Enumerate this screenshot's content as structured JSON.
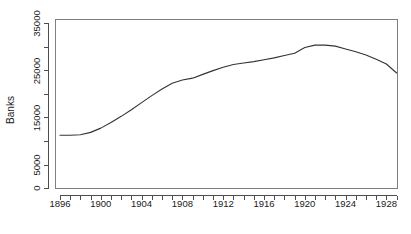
{
  "chart_data": {
    "type": "line",
    "title": "",
    "subtitle": "",
    "xlabel": "",
    "ylabel": "Banks",
    "xlim": [
      1895.0,
      1929.8
    ],
    "ylim": [
      0,
      36000
    ],
    "grid": false,
    "legend": null,
    "y_ticks": [
      0,
      5000,
      10000,
      15000,
      20000,
      25000,
      30000,
      35000
    ],
    "y_tick_labels": [
      "0",
      "5000",
      "",
      "15000",
      "",
      "25000",
      "",
      "35000"
    ],
    "x_ticks": [
      1896,
      1897,
      1898,
      1899,
      1900,
      1901,
      1902,
      1903,
      1904,
      1905,
      1906,
      1907,
      1908,
      1909,
      1910,
      1911,
      1912,
      1913,
      1914,
      1915,
      1916,
      1917,
      1918,
      1919,
      1920,
      1921,
      1922,
      1923,
      1924,
      1925,
      1926,
      1927,
      1928,
      1929
    ],
    "x_tick_labels": [
      "1896",
      "",
      "",
      "",
      "1900",
      "",
      "",
      "",
      "1904",
      "",
      "",
      "",
      "1908",
      "",
      "",
      "",
      "1912",
      "",
      "",
      "",
      "1916",
      "",
      "",
      "",
      "1920",
      "",
      "",
      "",
      "1924",
      "",
      "",
      "",
      "1928",
      ""
    ],
    "series": [
      {
        "name": "Banks",
        "x": [
          1896,
          1897,
          1898,
          1899,
          1900,
          1901,
          1902,
          1903,
          1904,
          1905,
          1906,
          1907,
          1908,
          1909,
          1910,
          1911,
          1912,
          1913,
          1914,
          1915,
          1916,
          1917,
          1918,
          1919,
          1920,
          1921,
          1922,
          1923,
          1924,
          1925,
          1926,
          1927,
          1928,
          1929
        ],
        "values": [
          11200,
          11200,
          11300,
          11800,
          12700,
          13900,
          15200,
          16600,
          18100,
          19600,
          21000,
          22200,
          22900,
          23300,
          24100,
          24900,
          25600,
          26200,
          26500,
          26800,
          27200,
          27600,
          28100,
          28600,
          29800,
          30300,
          30300,
          30100,
          29500,
          28900,
          28200,
          27300,
          26300,
          24400
        ]
      }
    ]
  },
  "axis": {
    "ylabel": "Banks",
    "ytick_0": "0",
    "ytick_5000": "5000",
    "ytick_15000": "15000",
    "ytick_25000": "25000",
    "ytick_35000": "35000",
    "xtick_1896": "1896",
    "xtick_1900": "1900",
    "xtick_1904": "1904",
    "xtick_1908": "1908",
    "xtick_1912": "1912",
    "xtick_1916": "1916",
    "xtick_1920": "1920",
    "xtick_1924": "1924",
    "xtick_1928": "1928"
  },
  "colors": {
    "line": "#333333",
    "axis": "#4d4d4d",
    "frame": "#808080",
    "background": "#ffffff"
  }
}
